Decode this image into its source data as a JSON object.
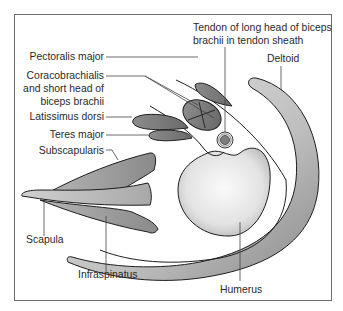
{
  "diagram": {
    "type": "anatomical cross-section of shoulder",
    "labels": {
      "pectoralis_major": "Pectoralis major",
      "coracobrachialis_1": "Coracobrachialis",
      "coracobrachialis_2": "and short head of",
      "coracobrachialis_3": "biceps brachii",
      "latissimus_dorsi": "Latissimus dorsi",
      "teres_major": "Teres major",
      "subscapularis": "Subscapularis",
      "scapula": "Scapula",
      "infraspinatus": "Infraspinatus",
      "humerus": "Humerus",
      "deltoid": "Deltoid",
      "tendon_1": "Tendon of long head of biceps",
      "tendon_2": "brachii in tendon sheath"
    },
    "colors": {
      "frame": "#6d6d6d",
      "outline": "#1e1e1e",
      "muscle_dark": "#7a7a7a",
      "muscle_light": "#d8d8d8",
      "bone_light": "#f2f2f2",
      "leader": "#444444"
    }
  }
}
